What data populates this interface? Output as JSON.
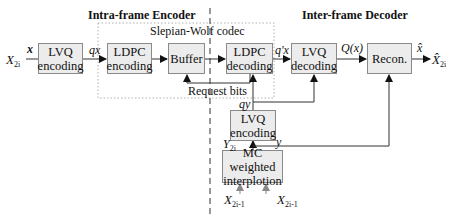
{
  "sections": {
    "encoder_title": "Intra-frame Encoder",
    "decoder_title": "Inter-frame Decoder",
    "sw_codec_label": "Slepian-Wolf codec"
  },
  "blocks": {
    "lvq_enc": {
      "line1": "LVQ",
      "line2": "encoding"
    },
    "ldpc_enc": {
      "line1": "LDPC",
      "line2": "encoding"
    },
    "buffer": {
      "line1": "Buffer"
    },
    "ldpc_dec": {
      "line1": "LDPC",
      "line2": "decoding"
    },
    "lvq_dec": {
      "line1": "LVQ",
      "line2": "decoding"
    },
    "recon": {
      "line1": "Recon."
    },
    "lvq_enc_side": {
      "line1": "LVQ",
      "line2": "encoding"
    },
    "mc_interp": {
      "line1": "MC weighted",
      "line2": "interplotion"
    }
  },
  "signals": {
    "input_X": "X",
    "input_X_sub": "2i",
    "x": "x",
    "qx": "qx",
    "q_prime_x": "q'x",
    "Q_x": "Q(x)",
    "x_hat": "x̂",
    "output_X_hat": "X̂",
    "output_X_sub": "2i",
    "request_bits": "Request bits",
    "qy": "qy",
    "y": "y",
    "Y": "Y",
    "Y_sub": "2i",
    "X_prev": "X",
    "X_prev_sub": "2i-1",
    "X_next": "X",
    "X_next_sub": "2i-1"
  },
  "colors": {
    "box_fill": "#ececec",
    "box_border": "#8a8a8a",
    "line": "#333333",
    "dotted": "#b0b0b0"
  }
}
